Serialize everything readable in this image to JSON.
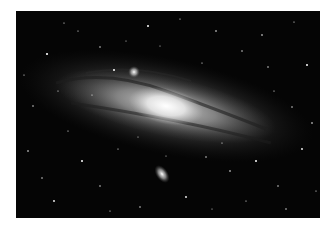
{
  "image": {
    "subject": "Andromeda galaxy (M31) with satellite galaxies M32 and M110 against a star field",
    "colors": {
      "background": "#ffffff",
      "sky": "#050505",
      "core": "#ffffff",
      "disk": "#9a9a9a",
      "dust_lanes": "#2a2a2a"
    }
  }
}
